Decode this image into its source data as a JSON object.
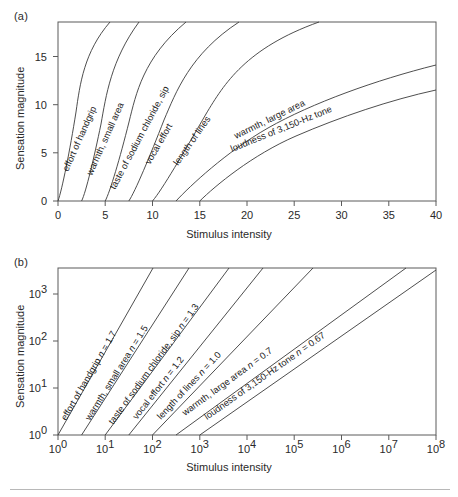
{
  "figure": {
    "divider_color": "#b8b8b8",
    "curve_color": "#3a3a3a",
    "frame_color": "#5a5a5a"
  },
  "panel_a": {
    "label": "(a)",
    "xlabel": "Stimulus intensity",
    "ylabel": "Sensation magnitude",
    "xticks": [
      "0",
      "5",
      "10",
      "15",
      "20",
      "25",
      "30",
      "35",
      "40"
    ],
    "yticks": [
      "0",
      "5",
      "10",
      "15"
    ]
  },
  "panel_b": {
    "label": "(b)",
    "xlabel": "Stimulus intensity",
    "ylabel": "Sensation magnitude",
    "xticks": [
      "0",
      "1",
      "2",
      "3",
      "4",
      "5",
      "6",
      "7",
      "8"
    ],
    "xtick_base": "10",
    "yticks": [
      "0",
      "1",
      "2",
      "3"
    ],
    "ytick_base": "10"
  },
  "chart_data": [
    {
      "type": "line",
      "panel": "a",
      "title": "",
      "xlabel": "Stimulus intensity",
      "ylabel": "Sensation magnitude",
      "xlim": [
        0,
        40.5
      ],
      "ylim": [
        0,
        18.6
      ],
      "grid": false,
      "legend": "inline-curve-labels",
      "note": "Stevens power law psi = k*(phi - threshold)^n plotted on linear axes",
      "series": [
        {
          "name": "effort of handgrip",
          "exponent": 1.7,
          "threshold": 0,
          "label": "effort of handgrip",
          "points": [
            [
              0,
              0
            ],
            [
              1,
              0.9
            ],
            [
              2,
              2.9
            ],
            [
              3,
              5.8
            ],
            [
              4,
              9.5
            ],
            [
              5,
              13.9
            ],
            [
              5.6,
              16.9
            ]
          ]
        },
        {
          "name": "warmth, small area",
          "exponent": 1.5,
          "threshold": 2.5,
          "label": "warmth, small area",
          "points": [
            [
              2.5,
              0
            ],
            [
              3.5,
              1.4
            ],
            [
              4.5,
              2.9
            ],
            [
              5.5,
              5.5
            ],
            [
              6.5,
              8.5
            ],
            [
              7.5,
              12.0
            ],
            [
              8.6,
              16.9
            ]
          ]
        },
        {
          "name": "taste of sodium chloride, sip",
          "exponent": 1.3,
          "threshold": 5,
          "label": "taste of sodium chloride, sip",
          "points": [
            [
              5,
              0
            ],
            [
              6,
              1.3
            ],
            [
              7.5,
              3.4
            ],
            [
              9,
              6.1
            ],
            [
              10.5,
              9.2
            ],
            [
              12,
              12.7
            ],
            [
              13.6,
              16.9
            ]
          ]
        },
        {
          "name": "vocal effort",
          "exponent": 1.2,
          "threshold": 7.5,
          "label": "vocal effort",
          "points": [
            [
              7.5,
              0
            ],
            [
              9,
              1.6
            ],
            [
              11,
              4.1
            ],
            [
              13,
              7.0
            ],
            [
              15,
              10.1
            ],
            [
              17,
              13.5
            ],
            [
              19.2,
              16.9
            ]
          ]
        },
        {
          "name": "length of lines",
          "exponent": 1.0,
          "threshold": 10,
          "label": "length of lines",
          "points": [
            [
              10,
              0
            ],
            [
              12,
              1.9
            ],
            [
              15,
              4.8
            ],
            [
              18,
              7.7
            ],
            [
              21,
              10.5
            ],
            [
              24,
              13.4
            ],
            [
              27.6,
              16.9
            ]
          ]
        },
        {
          "name": "warmth, large area",
          "exponent": 0.7,
          "threshold": 12.5,
          "label": "warmth, large area",
          "points": [
            [
              12.5,
              0
            ],
            [
              15,
              2.3
            ],
            [
              20,
              5.1
            ],
            [
              25,
              7.4
            ],
            [
              30,
              9.5
            ],
            [
              35,
              11.4
            ],
            [
              40.2,
              14.1
            ]
          ]
        },
        {
          "name": "loudness of 3,150-Hz tone",
          "exponent": 0.67,
          "threshold": 15,
          "label": "loudness of 3,150-Hz tone",
          "points": [
            [
              15,
              0
            ],
            [
              18,
              2.0
            ],
            [
              22,
              4.3
            ],
            [
              27,
              6.6
            ],
            [
              32,
              8.6
            ],
            [
              36,
              10.1
            ],
            [
              40.2,
              11.5
            ]
          ]
        }
      ]
    },
    {
      "type": "line",
      "panel": "b",
      "title": "",
      "xlabel": "Stimulus intensity",
      "ylabel": "Sensation magnitude",
      "xlim_log10": [
        0,
        8
      ],
      "ylim_log10": [
        0,
        3.55
      ],
      "xscale": "log",
      "yscale": "log",
      "grid": false,
      "legend": "inline-curve-labels",
      "note": "Same power functions in log-log coordinates; slope equals the exponent n",
      "series": [
        {
          "name": "effort of handgrip",
          "exponent": 1.7,
          "label": "effort of handgrip n = 1.7",
          "x_start_log10": 0.0,
          "n_text": "1.7"
        },
        {
          "name": "warmth, small area",
          "exponent": 1.5,
          "label": "warmth, small area n = 1.5",
          "x_start_log10": 0.5,
          "n_text": "1.5"
        },
        {
          "name": "taste of sodium chloride, sip",
          "exponent": 1.3,
          "label": "taste of sodium chloride, sip n = 1.3",
          "x_start_log10": 1.0,
          "n_text": "1.3"
        },
        {
          "name": "vocal effort",
          "exponent": 1.2,
          "label": "vocal effort n = 1.2",
          "x_start_log10": 1.5,
          "n_text": "1.2"
        },
        {
          "name": "length of lines",
          "exponent": 1.0,
          "label": "length of lines n = 1.0",
          "x_start_log10": 2.0,
          "n_text": "1.0"
        },
        {
          "name": "warmth, large area",
          "exponent": 0.7,
          "label": "warmth, large area n = 0.7",
          "x_start_log10": 2.5,
          "n_text": "0.7"
        },
        {
          "name": "loudness of 3,150-Hz tone",
          "exponent": 0.67,
          "label": "loudness of 3,150-Hz tone n = 0.67",
          "x_start_log10": 3.0,
          "n_text": "0.67"
        }
      ]
    }
  ]
}
